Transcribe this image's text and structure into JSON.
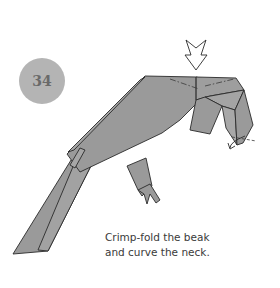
{
  "step": {
    "number": "34"
  },
  "caption": {
    "line1": "Crimp-fold the beak",
    "line2": "and curve the neck."
  },
  "colors": {
    "paper": "#9a9a9a",
    "line": "#2a2a2a",
    "badge": "#b4b4b4",
    "badge_text": "#6a6a6a"
  },
  "icons": [
    "push-arrow-icon",
    "curl-arrow-icon",
    "valley-fold-line",
    "mountain-fold-line"
  ]
}
